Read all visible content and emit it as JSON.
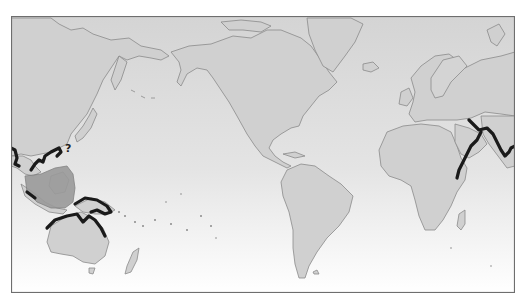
{
  "map": {
    "projection": "world map, Pacific-centered (Americas in middle)",
    "style": "grayscale",
    "colors": {
      "frame": "#6e6e6e",
      "ocean_top": "#d6d6d6",
      "ocean_bottom": "#ffffff",
      "land": "#d2d2d2",
      "coastline": "#8c8c8c",
      "range_confirmed": "#1a1a1a",
      "range_shaded": "#9a9a9a"
    },
    "uncertain_marker": "?",
    "highlighted_ranges": [
      {
        "name": "Persian Gulf coast",
        "style": "thick black coastline"
      },
      {
        "name": "Arabian Sea / Indian coast",
        "style": "thick black coastline"
      },
      {
        "name": "East African coast",
        "style": "thick black coastline"
      },
      {
        "name": "Southeast Asian coast",
        "style": "thick black coastline"
      },
      {
        "name": "Indonesian archipelago / South China Sea",
        "style": "gray shaded area"
      },
      {
        "name": "New Guinea coast",
        "style": "thick black coastline"
      },
      {
        "name": "Northern Australian coast",
        "style": "thick black coastline"
      },
      {
        "name": "Ryukyu / Taiwan region",
        "style": "question mark (uncertain)"
      }
    ]
  }
}
